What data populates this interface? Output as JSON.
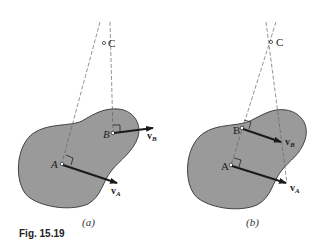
{
  "figure": {
    "caption": "Fig. 15.19",
    "colors": {
      "body_fill": "#9a9a9a",
      "outline": "#333333",
      "arrow": "#1a1a1a",
      "dashed": "#666666"
    }
  },
  "panels": [
    {
      "label": "(a)",
      "points": {
        "C": "C",
        "A": "A",
        "B": "B"
      },
      "vectors": [
        {
          "symbol": "v",
          "subscript": "A"
        },
        {
          "symbol": "v",
          "subscript": "B"
        }
      ]
    },
    {
      "label": "(b)",
      "points": {
        "C": "C",
        "A": "A",
        "B": "B"
      },
      "vectors": [
        {
          "symbol": "v",
          "subscript": "B"
        },
        {
          "symbol": "v",
          "subscript": "A"
        }
      ]
    }
  ]
}
